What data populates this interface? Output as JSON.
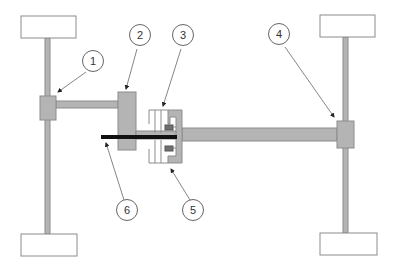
{
  "diagram": {
    "colors": {
      "background": "#ffffff",
      "part_fill": "#b4b4b4",
      "part_stroke": "#8c8c8c",
      "dark_part": "#707070",
      "rod": "#111111",
      "wheel_fill": "#ffffff",
      "wheel_stroke": "#8c8c8c",
      "callout_stroke": "#666666"
    },
    "callouts": [
      {
        "id": "1",
        "label": "1"
      },
      {
        "id": "2",
        "label": "2"
      },
      {
        "id": "3",
        "label": "3"
      },
      {
        "id": "4",
        "label": "4"
      },
      {
        "id": "5",
        "label": "5"
      },
      {
        "id": "6",
        "label": "6"
      }
    ],
    "wheels": [
      "front-left",
      "front-right",
      "rear-left",
      "rear-right"
    ]
  }
}
